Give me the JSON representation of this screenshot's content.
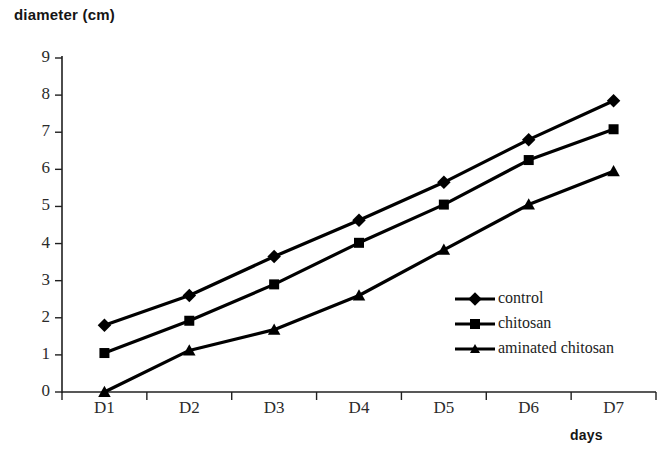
{
  "chart_data": {
    "type": "line",
    "title": "",
    "ylabel": "diameter (cm)",
    "xlabel": "days",
    "categories": [
      "D1",
      "D2",
      "D3",
      "D4",
      "D5",
      "D6",
      "D7"
    ],
    "ylim": [
      0,
      9
    ],
    "yticks": [
      "0",
      "1",
      "2",
      "3",
      "4",
      "5",
      "6",
      "7",
      "8",
      "9"
    ],
    "grid": false,
    "legend_position": "center-right",
    "series": [
      {
        "name": "control",
        "marker": "diamond",
        "color": "#000000",
        "values": [
          1.8,
          2.6,
          3.65,
          4.63,
          5.65,
          6.8,
          7.85
        ]
      },
      {
        "name": "chitosan",
        "marker": "square",
        "color": "#000000",
        "values": [
          1.05,
          1.92,
          2.9,
          4.02,
          5.05,
          6.25,
          7.08
        ]
      },
      {
        "name": "aminated chitosan",
        "marker": "triangle",
        "color": "#000000",
        "values": [
          0.0,
          1.12,
          1.68,
          2.6,
          3.83,
          5.05,
          5.95
        ]
      }
    ]
  },
  "legend": {
    "items": [
      {
        "label": "control"
      },
      {
        "label": "chitosan"
      },
      {
        "label": "aminated chitosan"
      }
    ]
  },
  "artifact": {
    "bottom_text": "caption text partially cut off at page edge"
  }
}
